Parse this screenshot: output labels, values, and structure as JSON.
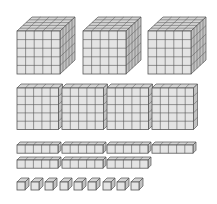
{
  "diagram": {
    "colors": {
      "front": "#e4e4e4",
      "top": "#d4d4d4",
      "side": "#c2c2c2",
      "line": "#555555",
      "background": "#ffffff"
    },
    "groups": [
      {
        "name": "thousands-cubes",
        "label": "Thousand cubes",
        "count": 3,
        "unit_size": 8.6,
        "grid": [
          5,
          5,
          5
        ],
        "items": [
          {
            "x": 17,
            "y": 31
          },
          {
            "x": 83,
            "y": 31
          },
          {
            "x": 148,
            "y": 31
          }
        ],
        "depth_dx": 15,
        "depth_dy": 14
      },
      {
        "name": "hundreds-flats",
        "label": "Hundred flats",
        "count": 4,
        "unit_size": 8.3,
        "grid": [
          5,
          5,
          1
        ],
        "items": [
          {
            "x": 17,
            "y": 88
          },
          {
            "x": 62,
            "y": 88
          },
          {
            "x": 107,
            "y": 88
          },
          {
            "x": 152,
            "y": 88
          }
        ],
        "depth_dx": 4,
        "depth_dy": 4
      },
      {
        "name": "tens-rods",
        "label": "Ten rods",
        "count": 7,
        "unit_size": 8.2,
        "grid": [
          5,
          1,
          1
        ],
        "items": [
          {
            "x": 17,
            "y": 145
          },
          {
            "x": 62,
            "y": 145
          },
          {
            "x": 107,
            "y": 145
          },
          {
            "x": 152,
            "y": 145
          },
          {
            "x": 17,
            "y": 160
          },
          {
            "x": 62,
            "y": 160
          },
          {
            "x": 107,
            "y": 160
          }
        ],
        "depth_dx": 3,
        "depth_dy": 3
      },
      {
        "name": "ones-units",
        "label": "Unit cubes",
        "count": 9,
        "unit_size": 8,
        "grid": [
          1,
          1,
          1
        ],
        "items": [
          {
            "x": 17,
            "y": 182
          },
          {
            "x": 31,
            "y": 182
          },
          {
            "x": 45,
            "y": 182
          },
          {
            "x": 60,
            "y": 182
          },
          {
            "x": 74,
            "y": 182
          },
          {
            "x": 88,
            "y": 182
          },
          {
            "x": 103,
            "y": 182
          },
          {
            "x": 117,
            "y": 182
          },
          {
            "x": 131,
            "y": 182
          }
        ],
        "depth_dx": 4,
        "depth_dy": 4
      }
    ]
  }
}
